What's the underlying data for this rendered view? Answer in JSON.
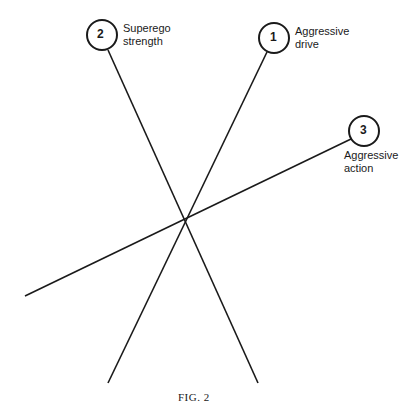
{
  "diagram": {
    "nodes": [
      {
        "id": "1",
        "number": "1",
        "label_line1": "Aggressive",
        "label_line2": "drive",
        "cx": 274,
        "cy": 38
      },
      {
        "id": "2",
        "number": "2",
        "label_line1": "Superego",
        "label_line2": "strength",
        "cx": 102,
        "cy": 35
      },
      {
        "id": "3",
        "number": "3",
        "label_line1": "Aggressive",
        "label_line2": "action",
        "cx": 364,
        "cy": 131
      }
    ],
    "intersection": {
      "x": 186,
      "y": 220
    },
    "line_color": "#1a1a1a"
  },
  "caption": "FIG. 2"
}
